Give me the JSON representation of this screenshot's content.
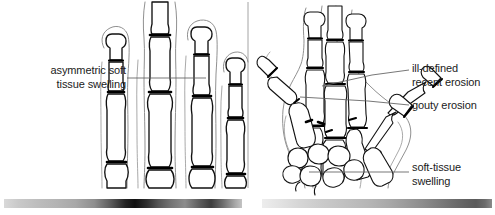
{
  "figure": {
    "background_color": "#ffffff",
    "ink_color": "#111111",
    "soft_tissue_color": "#7a7a7a",
    "leader_color": "#5a5a5a",
    "divider_color": "#8a8a8a"
  },
  "panels": {
    "left": {
      "name": "close-up of fingers",
      "divider_x": 248
    },
    "right": {
      "name": "whole hand, dorsopalmar view"
    }
  },
  "labels": {
    "asymmetric_swelling": "asymmetric soft\ntissue swelling",
    "ill_defined_erosion": "ill-defined\nrecent erosion",
    "gouty_erosion": "gouty erosion",
    "soft_tissue_swelling": "soft-tissue\nswelling"
  },
  "leader_lines": {
    "asymmetric_swelling": "128,78 to 205,78",
    "ill_defined_erosion": "408,70 to 318,86",
    "gouty_erosion": "408,105 to 300,98",
    "soft_tissue_swelling": "408,172 to 310,172"
  },
  "gradient_strips": {
    "left": "dark banded grayscale gradient",
    "right": "light to mid grayscale gradient"
  }
}
